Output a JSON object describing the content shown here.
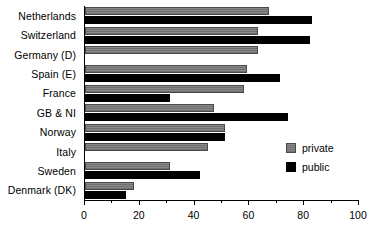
{
  "chart_data": {
    "type": "bar",
    "orientation": "horizontal",
    "title": "",
    "subtitle": "",
    "xlabel": "",
    "ylabel": "",
    "xlim": [
      0,
      100
    ],
    "grid": false,
    "legend_position": "right",
    "xticks": [
      0,
      20,
      40,
      60,
      80,
      100
    ],
    "xtick_labels": [
      "0",
      "20",
      "40",
      "60",
      "80",
      "100"
    ],
    "xticks_minor": [
      10,
      30,
      50,
      70,
      90
    ],
    "categories": [
      "Netherlands",
      "Switzerland",
      "Germany (D)",
      "Spain (E)",
      "France",
      "GB & NI",
      "Norway",
      "Italy",
      "Sweden",
      "Denmark (DK)"
    ],
    "series": [
      {
        "name": "private",
        "color": "#7a7a7a",
        "values": [
          67,
          63,
          63,
          59,
          58,
          47,
          51,
          45,
          31,
          18
        ]
      },
      {
        "name": "public",
        "color": "#000000",
        "values": [
          83,
          82,
          0,
          71,
          31,
          74,
          51,
          0,
          42,
          15
        ]
      }
    ]
  },
  "legend": {
    "items": [
      {
        "label": "private"
      },
      {
        "label": "public"
      }
    ]
  }
}
